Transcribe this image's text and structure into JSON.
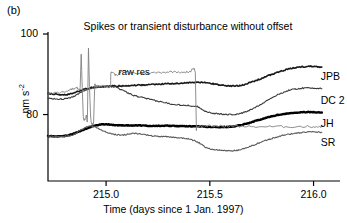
{
  "panel": {
    "label": "(b)"
  },
  "chart_data": {
    "type": "line",
    "title": "Spikes or transient disturbance without offset",
    "xlabel": "Time (days since 1 Jan. 1997)",
    "ylabel": "nm s",
    "ylabel_exponent": "-2",
    "xlim": [
      214.72,
      216.06
    ],
    "ylim": [
      63.5,
      100.5
    ],
    "xticks": [
      215.0,
      215.5,
      216.0
    ],
    "xtick_labels": [
      "215.0",
      "215.5",
      "216.0"
    ],
    "yticks": [
      80,
      100
    ],
    "ytick_labels": [
      "80",
      "100"
    ],
    "grid": false,
    "legend_position": "right-inline",
    "annotations": [
      {
        "text": "raw res",
        "x": 215.06,
        "y": 90.2
      }
    ],
    "series": [
      {
        "name": "JPB",
        "color": "#1a1a1a",
        "width": 1.6,
        "label_x": 216.02,
        "label_y": 89.6,
        "x": [
          214.72,
          214.76,
          214.8,
          214.84,
          214.88,
          214.92,
          214.96,
          215.0,
          215.04,
          215.08,
          215.12,
          215.16,
          215.2,
          215.24,
          215.28,
          215.32,
          215.36,
          215.4,
          215.44,
          215.48,
          215.52,
          215.56,
          215.6,
          215.64,
          215.68,
          215.72,
          215.76,
          215.8,
          215.84,
          215.88,
          215.92,
          215.96,
          216.0,
          216.04
        ],
        "y": [
          85.2,
          85.0,
          84.9,
          85.3,
          86.0,
          86.6,
          86.9,
          87.0,
          87.1,
          87.1,
          87.2,
          87.3,
          87.4,
          87.5,
          87.6,
          87.7,
          87.8,
          87.9,
          88.0,
          87.9,
          87.6,
          87.3,
          87.1,
          87.2,
          87.7,
          88.4,
          89.2,
          90.0,
          90.7,
          91.3,
          91.7,
          91.9,
          92.0,
          91.8
        ]
      },
      {
        "name": "DC 2",
        "color": "#3a3a3a",
        "width": 1.1,
        "label_x": 216.02,
        "label_y": 83.6,
        "x": [
          214.72,
          214.76,
          214.8,
          214.84,
          214.88,
          214.92,
          214.96,
          215.0,
          215.04,
          215.08,
          215.12,
          215.16,
          215.2,
          215.24,
          215.28,
          215.32,
          215.36,
          215.4,
          215.44,
          215.48,
          215.52,
          215.56,
          215.6,
          215.64,
          215.68,
          215.72,
          215.76,
          215.8,
          215.84,
          215.88,
          215.92,
          215.96,
          216.0,
          216.04
        ],
        "y": [
          84.0,
          83.9,
          83.9,
          84.4,
          85.5,
          86.4,
          86.8,
          86.9,
          86.9,
          86.0,
          85.0,
          84.4,
          83.9,
          83.4,
          83.0,
          82.6,
          82.4,
          82.2,
          82.0,
          80.8,
          80.3,
          80.1,
          80.0,
          80.2,
          80.8,
          81.8,
          83.0,
          84.2,
          85.2,
          86.0,
          86.4,
          86.6,
          86.6,
          86.4
        ]
      },
      {
        "name": "JH",
        "color": "#000000",
        "width": 2.4,
        "label_x": 216.02,
        "label_y": 78.0,
        "x": [
          214.72,
          214.76,
          214.8,
          214.84,
          214.88,
          214.92,
          214.96,
          215.0,
          215.04,
          215.08,
          215.12,
          215.16,
          215.2,
          215.24,
          215.28,
          215.32,
          215.36,
          215.4,
          215.44,
          215.48,
          215.52,
          215.56,
          215.6,
          215.64,
          215.68,
          215.72,
          215.76,
          215.8,
          215.84,
          215.88,
          215.92,
          215.96,
          216.0,
          216.04
        ],
        "y": [
          74.6,
          74.6,
          74.7,
          75.2,
          76.0,
          76.8,
          77.4,
          77.6,
          77.4,
          77.3,
          77.3,
          77.3,
          77.2,
          77.2,
          77.2,
          77.2,
          77.1,
          77.1,
          77.1,
          77.0,
          76.9,
          76.9,
          77.0,
          77.3,
          77.8,
          78.4,
          79.0,
          79.6,
          80.0,
          80.3,
          80.5,
          80.6,
          80.6,
          80.5
        ]
      },
      {
        "name": "SR",
        "color": "#5a5a5a",
        "width": 1.1,
        "label_x": 216.02,
        "label_y": 73.2,
        "x": [
          214.72,
          214.76,
          214.8,
          214.84,
          214.88,
          214.92,
          214.96,
          215.0,
          215.04,
          215.08,
          215.12,
          215.16,
          215.2,
          215.24,
          215.28,
          215.32,
          215.36,
          215.4,
          215.44,
          215.48,
          215.52,
          215.56,
          215.6,
          215.64,
          215.68,
          215.72,
          215.76,
          215.8,
          215.84,
          215.88,
          215.92,
          215.96,
          216.0,
          216.04
        ],
        "y": [
          74.6,
          74.5,
          74.6,
          75.0,
          76.2,
          77.2,
          76.6,
          75.6,
          75.1,
          74.9,
          75.3,
          75.2,
          74.9,
          74.6,
          74.5,
          74.4,
          74.2,
          73.9,
          73.2,
          71.9,
          71.3,
          71.1,
          71.0,
          71.2,
          71.8,
          72.6,
          73.4,
          74.1,
          74.7,
          75.1,
          75.4,
          75.6,
          75.7,
          75.6
        ]
      },
      {
        "name": "raw res",
        "color": "#808080",
        "width": 0.9,
        "x": [
          214.72,
          214.78,
          214.83,
          214.86,
          214.875,
          214.88,
          214.885,
          214.89,
          214.9,
          214.905,
          214.91,
          214.915,
          214.92,
          214.925,
          214.93,
          214.94,
          214.945,
          214.95,
          214.955,
          214.96,
          215.0,
          215.02,
          215.025,
          215.05,
          215.08,
          215.12,
          215.18,
          215.24,
          215.3,
          215.36,
          215.4,
          215.43,
          215.435,
          215.44,
          215.48,
          215.52,
          215.6,
          215.7,
          215.8,
          215.9,
          216.0,
          216.04
        ],
        "y": [
          85.2,
          85.5,
          86.3,
          86.6,
          86.7,
          95.0,
          86.8,
          79.5,
          78.9,
          80.0,
          79.2,
          96.5,
          86.9,
          80.0,
          78.0,
          78.3,
          87.0,
          87.0,
          87.0,
          87.0,
          87.0,
          87.0,
          90.5,
          89.8,
          90.8,
          90.4,
          90.2,
          90.4,
          90.6,
          90.6,
          90.5,
          90.5,
          77.2,
          77.2,
          77.2,
          77.1,
          77.1,
          77.0,
          77.0,
          77.0,
          77.0,
          77.0
        ]
      }
    ]
  },
  "axes": {
    "left_spine": true,
    "bottom_spine": true
  }
}
